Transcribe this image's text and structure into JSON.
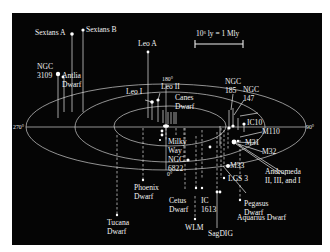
{
  "diagram": {
    "colors": {
      "background": "#050505",
      "lines": "#d8d8d8",
      "text": "#f2f2f2",
      "page": "#ffffff"
    },
    "scale_bar": {
      "label": "10⁶ ly = 1 Mly"
    },
    "angles": {
      "a0": "0°",
      "a90": "90°",
      "a180": "180°",
      "a270": "270°"
    },
    "galaxies": [
      {
        "id": "sextans-a",
        "label": "Sextans A"
      },
      {
        "id": "sextans-b",
        "label": "Sextans B"
      },
      {
        "id": "ngc-3109",
        "label": "NGC\n3109"
      },
      {
        "id": "antlia-dwarf",
        "label": "Antlia\nDwarf"
      },
      {
        "id": "leo-a",
        "label": "Leo A"
      },
      {
        "id": "leo-i",
        "label": "Leo I"
      },
      {
        "id": "leo-ii",
        "label": "Leo II"
      },
      {
        "id": "canes-dwarf",
        "label": "Canes\nDwarf"
      },
      {
        "id": "milky-way",
        "label": "Milky\nWay"
      },
      {
        "id": "ngc-6822",
        "label": "NGC\n6822"
      },
      {
        "id": "ngc-185",
        "label": "NGC\n185"
      },
      {
        "id": "ngc-147",
        "label": "NGC\n147"
      },
      {
        "id": "ic10",
        "label": "IC10"
      },
      {
        "id": "m110",
        "label": "M110"
      },
      {
        "id": "m31",
        "label": "M31"
      },
      {
        "id": "m32",
        "label": "M32"
      },
      {
        "id": "m33",
        "label": "M33"
      },
      {
        "id": "andromeda-dwarfs",
        "label": "Andromeda\nII, III, and I"
      },
      {
        "id": "lgs3",
        "label": "LGS 3"
      },
      {
        "id": "phoenix-dwarf",
        "label": "Phoenix\nDwarf"
      },
      {
        "id": "tucana-dwarf",
        "label": "Tucana\nDwarf"
      },
      {
        "id": "cetus-dwarf",
        "label": "Cetus\nDwarf"
      },
      {
        "id": "ic-1613",
        "label": "IC\n1613"
      },
      {
        "id": "wlm",
        "label": "WLM"
      },
      {
        "id": "sagdig",
        "label": "SagDIG"
      },
      {
        "id": "pegasus-dwarf",
        "label": "Pegasus\nDwarf"
      },
      {
        "id": "aquarius-dwarf",
        "label": "Aquarius Dwarf"
      }
    ]
  }
}
